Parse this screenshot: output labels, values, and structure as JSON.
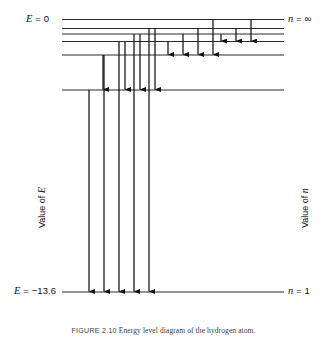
{
  "figure": {
    "width": 327,
    "height": 338,
    "background": "#ffffff",
    "line_color": "#2b2b2b",
    "arrow_color": "#111111"
  },
  "labels": {
    "energy_top_italic": "E",
    "energy_top_rest": " = 0",
    "quantum_top_italic": "n",
    "quantum_top_rest": " = ∞",
    "energy_bottom_italic": "E",
    "energy_bottom_rest": " = −13.6",
    "quantum_bottom_italic": "n",
    "quantum_bottom_rest": " = 1",
    "axis_left_prefix": "Value of ",
    "axis_left_italic": "E",
    "axis_right_prefix": "Value of ",
    "axis_right_italic": "n"
  },
  "caption": {
    "id": "FIGURE 2.10",
    "text": "Energy level diagram of the hydrogen atom."
  },
  "chart_data": {
    "type": "line",
    "title": "Energy level diagram of the hydrogen atom",
    "xlabel": "",
    "ylabel": "Value of E",
    "y2label": "Value of n",
    "grid": false,
    "legend": "none",
    "ylim": [
      -13.6,
      0
    ],
    "levels": [
      {
        "n": "∞",
        "energy_ev": 0.0,
        "y": 19.5,
        "x_start": 62,
        "x_end": 284
      },
      {
        "n": "6",
        "energy_ev": -0.38,
        "y": 28.5,
        "x_start": 62,
        "x_end": 284
      },
      {
        "n": "5",
        "energy_ev": -0.54,
        "y": 34.0,
        "x_start": 62,
        "x_end": 284
      },
      {
        "n": "4",
        "energy_ev": -0.85,
        "y": 41.5,
        "x_start": 62,
        "x_end": 284
      },
      {
        "n": "3",
        "energy_ev": -1.51,
        "y": 55.0,
        "x_start": 62,
        "x_end": 284
      },
      {
        "n": "2",
        "energy_ev": -3.4,
        "y": 90.0,
        "x_start": 62,
        "x_end": 284
      },
      {
        "n": "1",
        "energy_ev": -13.6,
        "y": 292.0,
        "x_start": 62,
        "x_end": 284
      }
    ],
    "transitions": [
      {
        "from_n": "5",
        "to_n": "4",
        "x": 221,
        "y_from": 34.0,
        "y_to": 41.5,
        "series": "Brackett"
      },
      {
        "from_n": "6",
        "to_n": "4",
        "x": 236,
        "y_from": 28.5,
        "y_to": 41.5,
        "series": "Brackett"
      },
      {
        "from_n": "∞",
        "to_n": "4",
        "x": 251,
        "y_from": 19.5,
        "y_to": 41.5,
        "series": "Brackett"
      },
      {
        "from_n": "4",
        "to_n": "3",
        "x": 168,
        "y_from": 41.5,
        "y_to": 55.0,
        "series": "Paschen"
      },
      {
        "from_n": "5",
        "to_n": "3",
        "x": 183,
        "y_from": 34.0,
        "y_to": 55.0,
        "series": "Paschen"
      },
      {
        "from_n": "6",
        "to_n": "3",
        "x": 198,
        "y_from": 28.5,
        "y_to": 55.0,
        "series": "Paschen"
      },
      {
        "from_n": "∞",
        "to_n": "3",
        "x": 213,
        "y_from": 19.5,
        "y_to": 55.0,
        "series": "Paschen"
      },
      {
        "from_n": "3",
        "to_n": "2",
        "x": 103,
        "y_from": 55.0,
        "y_to": 90.0,
        "series": "Balmer"
      },
      {
        "from_n": "4",
        "to_n": "2",
        "x": 125,
        "y_from": 41.5,
        "y_to": 90.0,
        "series": "Balmer"
      },
      {
        "from_n": "5",
        "to_n": "2",
        "x": 140,
        "y_from": 34.0,
        "y_to": 90.0,
        "series": "Balmer"
      },
      {
        "from_n": "6",
        "to_n": "2",
        "x": 155,
        "y_from": 28.5,
        "y_to": 90.0,
        "series": "Balmer"
      },
      {
        "from_n": "2",
        "to_n": "1",
        "x": 89,
        "y_from": 90.0,
        "y_to": 292.0,
        "series": "Lyman"
      },
      {
        "from_n": "3",
        "to_n": "1",
        "x": 104,
        "y_from": 55.0,
        "y_to": 292.0,
        "series": "Lyman"
      },
      {
        "from_n": "4",
        "to_n": "1",
        "x": 119,
        "y_from": 41.5,
        "y_to": 292.0,
        "series": "Lyman"
      },
      {
        "from_n": "5",
        "to_n": "1",
        "x": 134,
        "y_from": 34.0,
        "y_to": 292.0,
        "series": "Lyman"
      },
      {
        "from_n": "6",
        "to_n": "1",
        "x": 149,
        "y_from": 28.5,
        "y_to": 292.0,
        "series": "Lyman"
      }
    ]
  }
}
